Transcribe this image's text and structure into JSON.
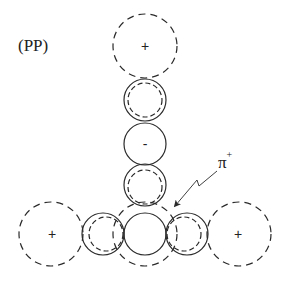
{
  "diagram": {
    "label": "(PP)",
    "probe": {
      "symbol": "π",
      "charge": "+"
    },
    "colors": {
      "stroke": "#2a2a2a",
      "background": "#ffffff"
    },
    "nodes": [
      {
        "id": "top-large",
        "style": "dashed",
        "cx": 145,
        "cy": 46,
        "r": 32,
        "sign": "+"
      },
      {
        "id": "upper-small",
        "style": "solid-with-dashed-inner",
        "cx": 145,
        "cy": 100,
        "r": 21,
        "sign": ""
      },
      {
        "id": "middle-small",
        "style": "solid",
        "cx": 145,
        "cy": 144,
        "r": 21,
        "sign": "-"
      },
      {
        "id": "lower-small",
        "style": "solid-with-dashed-inner",
        "cx": 145,
        "cy": 185,
        "r": 21,
        "sign": ""
      },
      {
        "id": "center",
        "style": "solid-with-dashed-outer",
        "cx": 145,
        "cy": 234,
        "r": 21,
        "sign": ""
      },
      {
        "id": "left-small",
        "style": "solid-with-dashed-inner",
        "cx": 103,
        "cy": 234,
        "r": 21,
        "sign": ""
      },
      {
        "id": "right-small",
        "style": "solid-with-dashed-inner",
        "cx": 187,
        "cy": 234,
        "r": 21,
        "sign": ""
      },
      {
        "id": "left-large",
        "style": "dashed",
        "cx": 51,
        "cy": 234,
        "r": 32,
        "sign": "+"
      },
      {
        "id": "right-large",
        "style": "dashed",
        "cx": 239,
        "cy": 234,
        "r": 32,
        "sign": "+"
      }
    ],
    "signs": {
      "top": "+",
      "middle": "-",
      "left": "+",
      "right": "+"
    }
  }
}
